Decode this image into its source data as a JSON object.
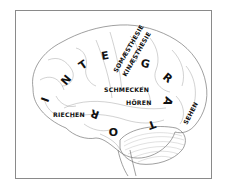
{
  "diagram": {
    "integrator_word": "INTEGRATOR",
    "integrator_letters": [
      "I",
      "N",
      "T",
      "E",
      "G",
      "R",
      "A",
      "T",
      "O",
      "R"
    ],
    "labels": {
      "somaesthesie": "SOMÆSTHESIE",
      "kinaesthesie": "KINÆSTHESIE",
      "schmecken": "SCHMECKEN",
      "hoeren": "HÖREN",
      "riechen": "RIECHEN",
      "sehen": "SEHEN"
    },
    "colors": {
      "ink": "#111111",
      "line": "#8a8a8a",
      "background": "#ffffff"
    }
  }
}
